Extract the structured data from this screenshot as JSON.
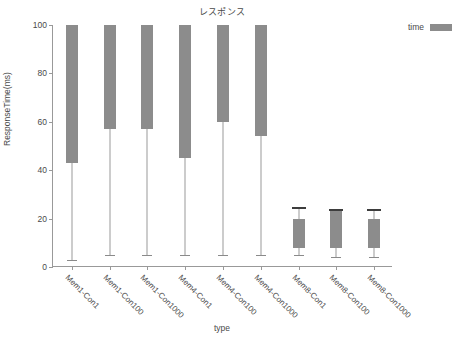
{
  "chart_data": {
    "type": "box",
    "title": "レスポンス",
    "xlabel": "type",
    "ylabel": "ResponseTime(ms)",
    "ylim": [
      0,
      100
    ],
    "yticks": [
      0,
      20,
      40,
      60,
      80,
      100
    ],
    "grid": false,
    "legend": {
      "position": "right",
      "entries": [
        {
          "name": "time",
          "color": "#8c8c8c"
        }
      ]
    },
    "categories": [
      "Mem1-Con1",
      "Mem1-Con100",
      "Mem1-Con1000",
      "Mem4-Con1",
      "Mem4-Con100",
      "Mem4-Con1000",
      "Mem8-Con1",
      "Mem8-Con100",
      "Mem8-Con1000"
    ],
    "series": [
      {
        "name": "time",
        "color": "#8c8c8c",
        "boxes": [
          {
            "category": "Mem1-Con1",
            "whisker_low": 3,
            "q1": 43,
            "q3": 100,
            "whisker_high": 100,
            "median": 100,
            "clipped_top": true
          },
          {
            "category": "Mem1-Con100",
            "whisker_low": 5,
            "q1": 57,
            "q3": 100,
            "whisker_high": 100,
            "median": 100,
            "clipped_top": true
          },
          {
            "category": "Mem1-Con1000",
            "whisker_low": 5,
            "q1": 57,
            "q3": 100,
            "whisker_high": 100,
            "median": 100,
            "clipped_top": true
          },
          {
            "category": "Mem4-Con1",
            "whisker_low": 5,
            "q1": 45,
            "q3": 100,
            "whisker_high": 100,
            "median": 100,
            "clipped_top": true
          },
          {
            "category": "Mem4-Con100",
            "whisker_low": 5,
            "q1": 60,
            "q3": 100,
            "whisker_high": 100,
            "median": 100,
            "clipped_top": true
          },
          {
            "category": "Mem4-Con1000",
            "whisker_low": 5,
            "q1": 54,
            "q3": 100,
            "whisker_high": 100,
            "median": 100,
            "clipped_top": true
          },
          {
            "category": "Mem8-Con1",
            "whisker_low": 5,
            "q1": 8,
            "q3": 20,
            "whisker_high": 25,
            "median": 20,
            "clipped_top": false
          },
          {
            "category": "Mem8-Con100",
            "whisker_low": 4,
            "q1": 8,
            "q3": 23,
            "whisker_high": 24,
            "median": 23,
            "clipped_top": false
          },
          {
            "category": "Mem8-Con1000",
            "whisker_low": 4,
            "q1": 8,
            "q3": 20,
            "whisker_high": 24,
            "median": 20,
            "clipped_top": false
          }
        ]
      }
    ]
  },
  "colors": {
    "box_fill": "#8c8c8c",
    "axis": "#999999",
    "text": "#4a4a4a",
    "background": "#ffffff"
  }
}
